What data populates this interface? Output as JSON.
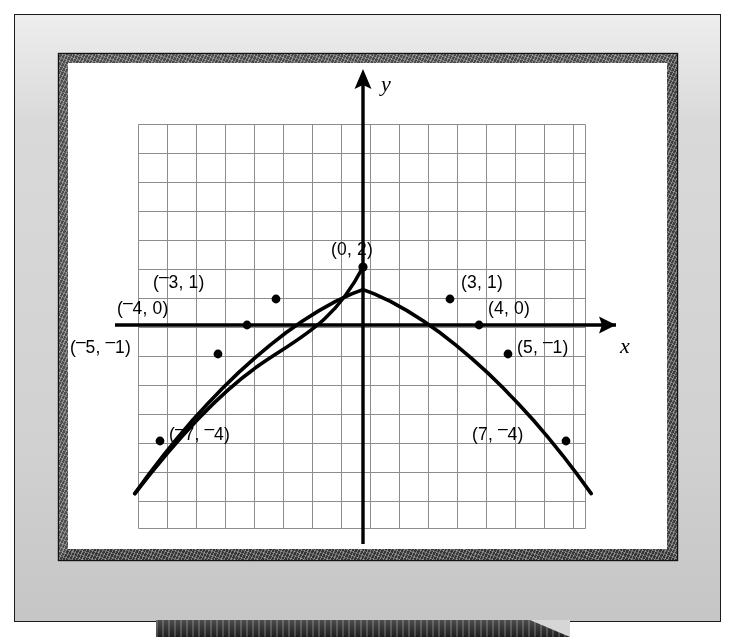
{
  "figure": {
    "kind": "coordinate-grid-parabola-on-whiteboard",
    "axis_labels": {
      "x": "x",
      "y": "y"
    }
  },
  "chart_data": {
    "type": "line",
    "title": "",
    "subtitle": "",
    "xlabel": "x",
    "ylabel": "y",
    "grid": true,
    "legend": "none",
    "equation": "y = 2 - x²/8",
    "xlim": [
      -7.8,
      7.7
    ],
    "ylim": [
      -9.2,
      5.0
    ],
    "gridstep": 1,
    "series": [
      {
        "name": "parabola",
        "x": [
          -7.9,
          -7,
          -5,
          -4,
          -3,
          0,
          3,
          4,
          5,
          7,
          7.9
        ],
        "y": [
          -5.8,
          -4.1,
          -1.1,
          0,
          0.875,
          2,
          0.875,
          0,
          -1.1,
          -4.1,
          -5.8
        ]
      }
    ],
    "points": [
      {
        "x": -7,
        "y": -4,
        "label": "(−7, −4)",
        "label_x": -6.3,
        "label_y": -3.45,
        "label_align": "left"
      },
      {
        "x": -5,
        "y": -1,
        "label": "(−5, −1)",
        "label_x": -7.75,
        "label_y": -1.3,
        "label_align": "left"
      },
      {
        "x": -4,
        "y": 0,
        "label": "(−4, 0)",
        "label_x": -6.15,
        "label_y": 0.72,
        "label_align": "left"
      },
      {
        "x": -3,
        "y": 1,
        "label": "(−3, 1)",
        "label_x": -5.6,
        "label_y": 1.6,
        "label_align": "left"
      },
      {
        "x": 0,
        "y": 2,
        "label": "(0, 2)",
        "label_x": -1.05,
        "label_y": 2.85,
        "label_align": "left"
      },
      {
        "x": 3,
        "y": 1,
        "label": "(3, 1)",
        "label_x": 3.35,
        "label_y": 1.6,
        "label_align": "left"
      },
      {
        "x": 4,
        "y": 0,
        "label": "(4, 0)",
        "label_x": 3.45,
        "label_y": 0.72,
        "label_align": "left"
      },
      {
        "x": 5,
        "y": -1,
        "label": "(5, −1)",
        "label_x": 5.3,
        "label_y": -1.3,
        "label_align": "left"
      },
      {
        "x": 7,
        "y": -4,
        "label": "(7, −4)",
        "label_x": 3.45,
        "label_y": -3.45,
        "label_align": "left"
      }
    ],
    "point_label_text": [
      "(−7, −4)",
      "(−5, −1)",
      "(−4, 0)",
      "(−3, 1)",
      "(0, 2)",
      "(3, 1)",
      "(4, 0)",
      "(5, −1)",
      "(7, −4)"
    ]
  },
  "colors": {
    "curve": "#000000",
    "axis": "#000000",
    "grid": "#8d8d8d",
    "board": "#ffffff",
    "frame": "#3f3f3f",
    "easel": "#d9d9d9"
  }
}
